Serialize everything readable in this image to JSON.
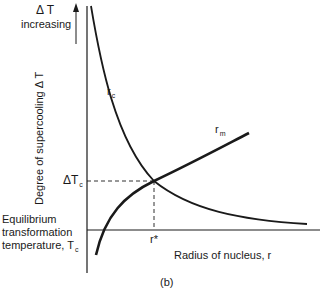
{
  "figure": {
    "panel_label": "(b)",
    "top_label": {
      "line1": "Δ T",
      "line2": "increasing"
    },
    "y_axis_label": "Degree of supercooling Δ T",
    "x_axis_label": "Radius of nucleus, r",
    "delta_tc_label": {
      "main": "ΔT",
      "sub": "c"
    },
    "equilibrium_label": {
      "line1": "Equilibrium",
      "line2": "transformation",
      "line3": "temperature, T",
      "sub": "c"
    },
    "r_star_label": "r*",
    "curves": [
      {
        "name": "r",
        "sub": "c",
        "description": "critical radius, decreases with increasing radius"
      },
      {
        "name": "r",
        "sub": "m",
        "description": "maximum radius, increases with radius"
      }
    ],
    "line_color": "#1a1a1a"
  }
}
